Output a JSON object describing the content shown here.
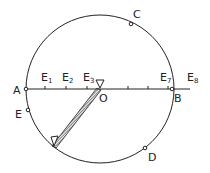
{
  "diagram": {
    "type": "circle-geometry",
    "colors": {
      "stroke": "#222222",
      "background": "#ffffff"
    },
    "circle": {
      "center_label": "O"
    },
    "points": [
      {
        "id": "A",
        "label": "A"
      },
      {
        "id": "B",
        "label": "B"
      },
      {
        "id": "C",
        "label": "C"
      },
      {
        "id": "D",
        "label": "D"
      },
      {
        "id": "E",
        "label": "E"
      },
      {
        "id": "O",
        "label": "O"
      }
    ],
    "ticks": [
      {
        "id": "E1",
        "base": "E",
        "sub": "1"
      },
      {
        "id": "E2",
        "base": "E",
        "sub": "2"
      },
      {
        "id": "E3",
        "base": "E",
        "sub": "3"
      },
      {
        "id": "E7",
        "base": "E",
        "sub": "7"
      },
      {
        "id": "E8",
        "base": "E",
        "sub": "8"
      }
    ],
    "rod": {
      "description": "hatched rod from O to lower-left on circle",
      "marker": "triangle"
    },
    "axis_marker": "triangle"
  }
}
